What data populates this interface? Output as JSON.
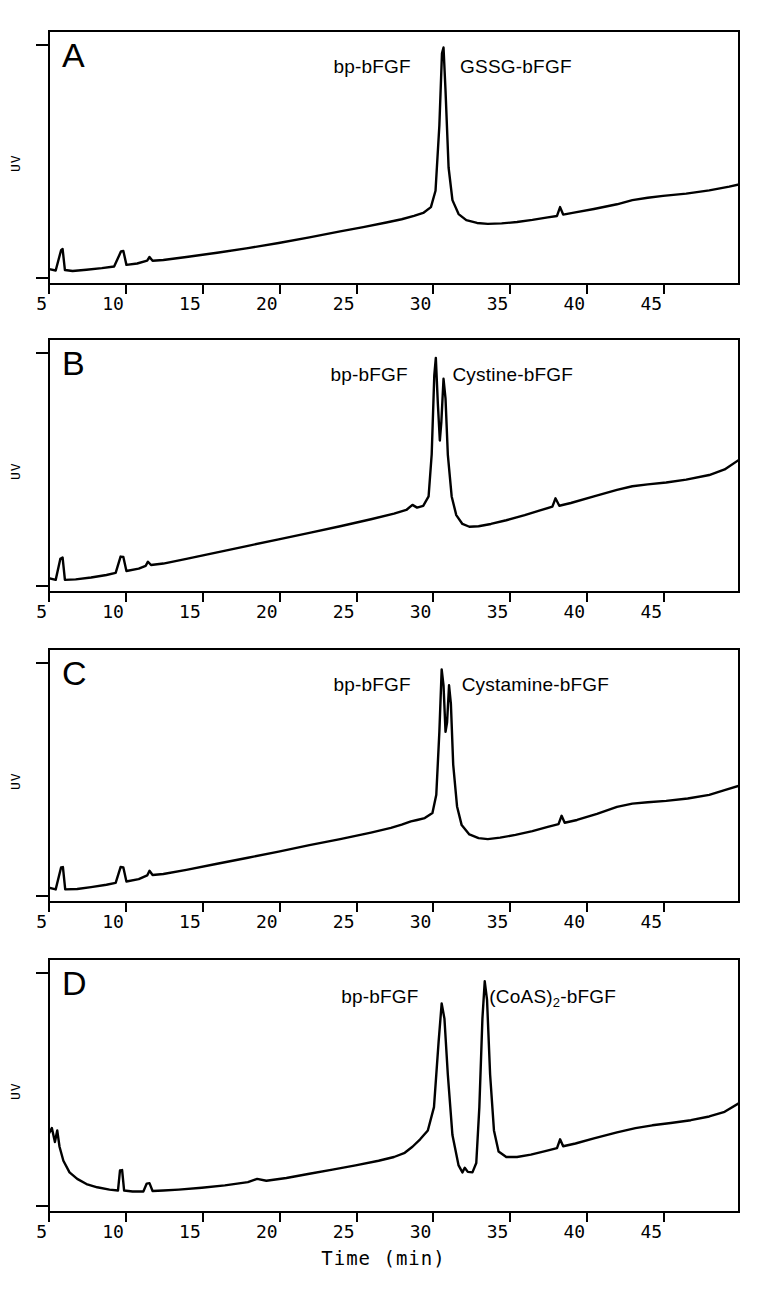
{
  "figure": {
    "axis_title": "Time  (min)",
    "y_axis_label": "UV",
    "x_ticks": [
      5,
      10,
      15,
      20,
      25,
      30,
      35,
      40,
      45
    ],
    "x_range": [
      5,
      50
    ]
  },
  "chart_data": {
    "type": "line",
    "title": "",
    "xlabel": "Time  (min)",
    "ylabel": "UV",
    "xlim": [
      5,
      50
    ],
    "grid": false,
    "legend": "none",
    "panels": [
      {
        "id": "A",
        "letter": "A",
        "labels": [
          {
            "text": "bp-bFGF",
            "x": 28.6,
            "align": "left"
          },
          {
            "text": "GSSG-bFGF",
            "x": 31.8,
            "align": "right"
          }
        ],
        "peaks": [
          {
            "name": "bp-bFGF / GSSG-bFGF",
            "time": 30.7,
            "height": 0.95
          }
        ],
        "minor_peaks": [
          {
            "time": 5.9,
            "height": 0.09
          },
          {
            "time": 9.8,
            "height": 0.07
          },
          {
            "time": 11.6,
            "height": 0.035
          },
          {
            "time": 38.3,
            "height": 0.03
          }
        ],
        "baseline": "rising drift from 0.02 to 0.55",
        "points": [
          [
            5.0,
            0.035
          ],
          [
            5.5,
            0.028
          ],
          [
            5.85,
            0.115
          ],
          [
            5.95,
            0.12
          ],
          [
            6.1,
            0.03
          ],
          [
            6.6,
            0.026
          ],
          [
            7.5,
            0.031
          ],
          [
            8.5,
            0.038
          ],
          [
            9.3,
            0.045
          ],
          [
            9.75,
            0.11
          ],
          [
            9.9,
            0.112
          ],
          [
            10.1,
            0.052
          ],
          [
            10.8,
            0.058
          ],
          [
            11.45,
            0.07
          ],
          [
            11.6,
            0.086
          ],
          [
            11.8,
            0.07
          ],
          [
            12.5,
            0.073
          ],
          [
            14,
            0.086
          ],
          [
            16,
            0.104
          ],
          [
            18,
            0.124
          ],
          [
            20,
            0.146
          ],
          [
            22,
            0.17
          ],
          [
            24,
            0.196
          ],
          [
            25.5,
            0.214
          ],
          [
            27,
            0.234
          ],
          [
            28,
            0.248
          ],
          [
            28.8,
            0.262
          ],
          [
            29.4,
            0.275
          ],
          [
            29.9,
            0.3
          ],
          [
            30.2,
            0.37
          ],
          [
            30.45,
            0.65
          ],
          [
            30.62,
            0.96
          ],
          [
            30.72,
            0.985
          ],
          [
            30.85,
            0.8
          ],
          [
            31.05,
            0.47
          ],
          [
            31.3,
            0.33
          ],
          [
            31.7,
            0.27
          ],
          [
            32.2,
            0.244
          ],
          [
            32.9,
            0.232
          ],
          [
            33.6,
            0.228
          ],
          [
            34.5,
            0.23
          ],
          [
            35.5,
            0.236
          ],
          [
            36.5,
            0.245
          ],
          [
            37.5,
            0.256
          ],
          [
            38.1,
            0.262
          ],
          [
            38.3,
            0.3
          ],
          [
            38.5,
            0.268
          ],
          [
            39.2,
            0.276
          ],
          [
            40.5,
            0.292
          ],
          [
            42,
            0.312
          ],
          [
            43,
            0.33
          ],
          [
            44,
            0.34
          ],
          [
            45,
            0.348
          ],
          [
            46.5,
            0.358
          ],
          [
            48,
            0.372
          ],
          [
            49.3,
            0.388
          ],
          [
            50,
            0.398
          ]
        ]
      },
      {
        "id": "B",
        "letter": "B",
        "labels": [
          {
            "text": "bp-bFGF",
            "x": 28.4,
            "align": "left"
          },
          {
            "text": "Cystine-bFGF",
            "x": 31.3,
            "align": "right"
          }
        ],
        "peaks": [
          {
            "name": "bp-bFGF",
            "time": 30.2,
            "height": 0.96
          },
          {
            "name": "Cystine-bFGF",
            "time": 30.75,
            "height": 0.88
          }
        ],
        "minor_peaks": [
          {
            "time": 5.85,
            "height": 0.09
          },
          {
            "time": 9.75,
            "height": 0.08
          },
          {
            "time": 11.5,
            "height": 0.04
          },
          {
            "time": 38.0,
            "height": 0.03
          }
        ],
        "baseline": "rising drift from 0.02 to 0.62",
        "points": [
          [
            5.0,
            0.03
          ],
          [
            5.5,
            0.022
          ],
          [
            5.8,
            0.112
          ],
          [
            5.95,
            0.118
          ],
          [
            6.1,
            0.022
          ],
          [
            6.8,
            0.024
          ],
          [
            7.8,
            0.032
          ],
          [
            8.8,
            0.043
          ],
          [
            9.4,
            0.052
          ],
          [
            9.72,
            0.122
          ],
          [
            9.9,
            0.12
          ],
          [
            10.1,
            0.06
          ],
          [
            10.9,
            0.07
          ],
          [
            11.35,
            0.082
          ],
          [
            11.5,
            0.1
          ],
          [
            11.7,
            0.086
          ],
          [
            12.5,
            0.092
          ],
          [
            14,
            0.112
          ],
          [
            16,
            0.14
          ],
          [
            18,
            0.168
          ],
          [
            20,
            0.196
          ],
          [
            22,
            0.224
          ],
          [
            24,
            0.252
          ],
          [
            26,
            0.282
          ],
          [
            27.5,
            0.306
          ],
          [
            28.3,
            0.322
          ],
          [
            28.7,
            0.344
          ],
          [
            29.0,
            0.332
          ],
          [
            29.4,
            0.34
          ],
          [
            29.75,
            0.38
          ],
          [
            29.95,
            0.56
          ],
          [
            30.12,
            0.9
          ],
          [
            30.22,
            0.975
          ],
          [
            30.35,
            0.78
          ],
          [
            30.48,
            0.62
          ],
          [
            30.58,
            0.7
          ],
          [
            30.72,
            0.885
          ],
          [
            30.85,
            0.8
          ],
          [
            31.0,
            0.56
          ],
          [
            31.25,
            0.38
          ],
          [
            31.55,
            0.3
          ],
          [
            31.95,
            0.262
          ],
          [
            32.4,
            0.25
          ],
          [
            33.0,
            0.252
          ],
          [
            33.8,
            0.262
          ],
          [
            34.8,
            0.278
          ],
          [
            36,
            0.3
          ],
          [
            37,
            0.32
          ],
          [
            37.8,
            0.336
          ],
          [
            38.0,
            0.372
          ],
          [
            38.25,
            0.34
          ],
          [
            39,
            0.352
          ],
          [
            40.5,
            0.38
          ],
          [
            42,
            0.408
          ],
          [
            43,
            0.424
          ],
          [
            44,
            0.432
          ],
          [
            45.2,
            0.44
          ],
          [
            46.5,
            0.452
          ],
          [
            48,
            0.472
          ],
          [
            49,
            0.496
          ],
          [
            50,
            0.54
          ]
        ]
      },
      {
        "id": "C",
        "letter": "C",
        "labels": [
          {
            "text": "bp-bFGF",
            "x": 28.6,
            "align": "left"
          },
          {
            "text": "Cystamine-bFGF",
            "x": 31.9,
            "align": "right"
          }
        ],
        "peaks": [
          {
            "name": "bp-bFGF",
            "time": 30.6,
            "height": 0.97
          },
          {
            "name": "Cystamine-bFGF",
            "time": 31.1,
            "height": 0.9
          }
        ],
        "minor_peaks": [
          {
            "time": 5.9,
            "height": 0.09
          },
          {
            "time": 9.75,
            "height": 0.08
          },
          {
            "time": 11.6,
            "height": 0.05
          },
          {
            "time": 38.4,
            "height": 0.03
          }
        ],
        "baseline": "rising drift from 0.02 to 0.58",
        "points": [
          [
            5.0,
            0.032
          ],
          [
            5.5,
            0.024
          ],
          [
            5.85,
            0.118
          ],
          [
            5.97,
            0.12
          ],
          [
            6.12,
            0.024
          ],
          [
            6.9,
            0.026
          ],
          [
            7.8,
            0.034
          ],
          [
            8.8,
            0.044
          ],
          [
            9.4,
            0.052
          ],
          [
            9.72,
            0.12
          ],
          [
            9.9,
            0.118
          ],
          [
            10.1,
            0.058
          ],
          [
            10.9,
            0.068
          ],
          [
            11.45,
            0.084
          ],
          [
            11.6,
            0.104
          ],
          [
            11.8,
            0.086
          ],
          [
            12.5,
            0.09
          ],
          [
            14,
            0.108
          ],
          [
            16,
            0.134
          ],
          [
            18,
            0.16
          ],
          [
            20,
            0.186
          ],
          [
            22,
            0.214
          ],
          [
            24,
            0.24
          ],
          [
            26,
            0.268
          ],
          [
            27.3,
            0.288
          ],
          [
            28.0,
            0.302
          ],
          [
            28.6,
            0.316
          ],
          [
            29.0,
            0.322
          ],
          [
            29.5,
            0.33
          ],
          [
            30.0,
            0.352
          ],
          [
            30.25,
            0.43
          ],
          [
            30.45,
            0.7
          ],
          [
            30.6,
            0.968
          ],
          [
            30.72,
            0.9
          ],
          [
            30.85,
            0.7
          ],
          [
            30.95,
            0.74
          ],
          [
            31.08,
            0.9
          ],
          [
            31.2,
            0.82
          ],
          [
            31.35,
            0.56
          ],
          [
            31.6,
            0.38
          ],
          [
            31.9,
            0.3
          ],
          [
            32.4,
            0.26
          ],
          [
            33.0,
            0.244
          ],
          [
            33.6,
            0.24
          ],
          [
            34.4,
            0.246
          ],
          [
            35.4,
            0.258
          ],
          [
            36.5,
            0.274
          ],
          [
            37.5,
            0.292
          ],
          [
            38.2,
            0.304
          ],
          [
            38.4,
            0.34
          ],
          [
            38.6,
            0.31
          ],
          [
            39.4,
            0.322
          ],
          [
            40.7,
            0.348
          ],
          [
            42,
            0.378
          ],
          [
            43,
            0.392
          ],
          [
            44,
            0.398
          ],
          [
            45.2,
            0.404
          ],
          [
            46.6,
            0.414
          ],
          [
            48,
            0.43
          ],
          [
            49,
            0.45
          ],
          [
            50,
            0.47
          ]
        ]
      },
      {
        "id": "D",
        "letter": "D",
        "labels": [
          {
            "text": "bp-bFGF",
            "x": 29.1,
            "align": "left"
          },
          {
            "text": "(CoAS)",
            "sub": "2",
            "suffix": "-bFGF",
            "x": 33.7,
            "align": "right"
          }
        ],
        "peaks": [
          {
            "name": "bp-bFGF",
            "time": 30.6,
            "height": 0.86
          },
          {
            "name": "(CoAS)2-bFGF",
            "time": 33.4,
            "height": 0.96
          }
        ],
        "minor_peaks": [
          {
            "time": 5.6,
            "height": 0.3
          },
          {
            "time": 9.7,
            "height": 0.12
          },
          {
            "time": 11.5,
            "height": 0.08
          },
          {
            "time": 32.1,
            "height": 0.13
          },
          {
            "time": 38.3,
            "height": 0.03
          }
        ],
        "baseline": "solvent front high at start, dips, then rises to 0.50",
        "points": [
          [
            5.0,
            0.3
          ],
          [
            5.25,
            0.33
          ],
          [
            5.45,
            0.27
          ],
          [
            5.6,
            0.32
          ],
          [
            5.75,
            0.25
          ],
          [
            6.0,
            0.19
          ],
          [
            6.4,
            0.14
          ],
          [
            6.9,
            0.112
          ],
          [
            7.5,
            0.09
          ],
          [
            8.2,
            0.076
          ],
          [
            9.0,
            0.066
          ],
          [
            9.55,
            0.062
          ],
          [
            9.68,
            0.148
          ],
          [
            9.82,
            0.15
          ],
          [
            9.95,
            0.062
          ],
          [
            10.5,
            0.058
          ],
          [
            11.2,
            0.058
          ],
          [
            11.42,
            0.092
          ],
          [
            11.6,
            0.094
          ],
          [
            11.8,
            0.06
          ],
          [
            12.5,
            0.062
          ],
          [
            13.5,
            0.066
          ],
          [
            15,
            0.074
          ],
          [
            16.5,
            0.084
          ],
          [
            18,
            0.098
          ],
          [
            18.6,
            0.112
          ],
          [
            19.2,
            0.104
          ],
          [
            20.5,
            0.116
          ],
          [
            22,
            0.134
          ],
          [
            23.5,
            0.152
          ],
          [
            25,
            0.17
          ],
          [
            26.5,
            0.19
          ],
          [
            27.5,
            0.206
          ],
          [
            28.2,
            0.224
          ],
          [
            28.7,
            0.25
          ],
          [
            29.2,
            0.282
          ],
          [
            29.7,
            0.32
          ],
          [
            30.1,
            0.42
          ],
          [
            30.4,
            0.7
          ],
          [
            30.6,
            0.865
          ],
          [
            30.78,
            0.8
          ],
          [
            31.0,
            0.56
          ],
          [
            31.3,
            0.3
          ],
          [
            31.7,
            0.17
          ],
          [
            31.95,
            0.14
          ],
          [
            32.1,
            0.16
          ],
          [
            32.3,
            0.142
          ],
          [
            32.6,
            0.14
          ],
          [
            32.85,
            0.18
          ],
          [
            33.05,
            0.42
          ],
          [
            33.25,
            0.8
          ],
          [
            33.4,
            0.96
          ],
          [
            33.55,
            0.88
          ],
          [
            33.75,
            0.56
          ],
          [
            34.0,
            0.32
          ],
          [
            34.3,
            0.23
          ],
          [
            34.8,
            0.206
          ],
          [
            35.5,
            0.206
          ],
          [
            36.4,
            0.216
          ],
          [
            37.4,
            0.232
          ],
          [
            38.1,
            0.244
          ],
          [
            38.3,
            0.282
          ],
          [
            38.5,
            0.252
          ],
          [
            39.3,
            0.264
          ],
          [
            40.5,
            0.286
          ],
          [
            42,
            0.312
          ],
          [
            43.2,
            0.33
          ],
          [
            44.3,
            0.342
          ],
          [
            45.5,
            0.352
          ],
          [
            46.8,
            0.364
          ],
          [
            48,
            0.38
          ],
          [
            49,
            0.4
          ],
          [
            50,
            0.44
          ]
        ]
      }
    ]
  }
}
